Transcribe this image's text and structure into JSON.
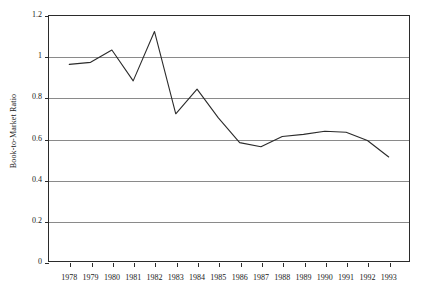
{
  "chart_data": {
    "type": "line",
    "title": "",
    "xlabel": "",
    "ylabel": "Book-to-Market Ratio",
    "x": [
      1978,
      1979,
      1980,
      1981,
      1982,
      1983,
      1984,
      1985,
      1986,
      1987,
      1988,
      1989,
      1990,
      1991,
      1992,
      1993
    ],
    "categories": [
      "1978",
      "1979",
      "1980",
      "1981",
      "1982",
      "1983",
      "1984",
      "1985",
      "1986",
      "1987",
      "1988",
      "1989",
      "1990",
      "1991",
      "1992",
      "1993"
    ],
    "values": [
      0.96,
      0.97,
      1.03,
      0.88,
      1.12,
      0.72,
      0.84,
      0.7,
      0.58,
      0.56,
      0.61,
      0.62,
      0.635,
      0.63,
      0.59,
      0.51
    ],
    "series": [
      {
        "name": "Book-to-Market Ratio",
        "values": [
          0.96,
          0.97,
          1.03,
          0.88,
          1.12,
          0.72,
          0.84,
          0.7,
          0.58,
          0.56,
          0.61,
          0.62,
          0.635,
          0.63,
          0.59,
          0.51
        ]
      }
    ],
    "ylim": [
      0,
      1.2
    ],
    "yticks": [
      0,
      0.2,
      0.4,
      0.6,
      0.8,
      1,
      1.2
    ],
    "ytick_labels": [
      "0",
      "0.2",
      "0.4",
      "0.6",
      "0.8",
      "1",
      "1.2"
    ],
    "grid": "horizontal",
    "legend": "none",
    "line_color": "#2b2b2b",
    "grid_color": "#8a8a8a",
    "axis_color": "#2b2b2b"
  }
}
